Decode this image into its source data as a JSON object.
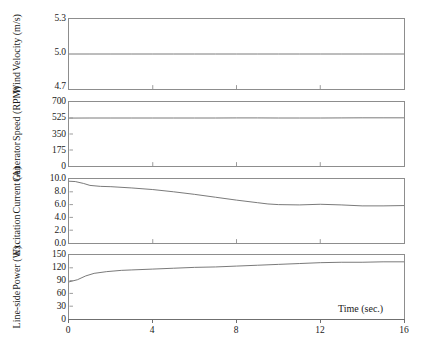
{
  "figure": {
    "xlabel": "Time (sec.)",
    "xticks": [
      "0",
      "4",
      "8",
      "12",
      "16"
    ],
    "xlim": [
      0,
      16
    ],
    "line_color": "#5f5f5f",
    "frame_color": "#8d8d8d"
  },
  "chart_data": [
    {
      "type": "line",
      "title": "",
      "panel_index": 0,
      "ylabel": "Wind Velocity (m/s)",
      "ylabel_lines": [
        "Wind",
        "Velocity (m/s)"
      ],
      "xlabel": "",
      "xlim": [
        0,
        16
      ],
      "ylim": [
        4.7,
        5.3
      ],
      "yticks": [
        "4.7",
        "5.0",
        "5.3"
      ],
      "ytick_values": [
        4.7,
        5.0,
        5.3
      ],
      "xticks": [
        "0",
        "4",
        "8",
        "12",
        "16"
      ],
      "grid": false,
      "legend": "none",
      "x": [
        0,
        1,
        2,
        3,
        4,
        5,
        6,
        7,
        8,
        9,
        10,
        11,
        12,
        13,
        14,
        15,
        16
      ],
      "values": [
        5.0,
        5.0,
        5.0,
        5.0,
        5.0,
        5.0,
        5.0,
        5.0,
        5.0,
        5.0,
        5.0,
        5.0,
        5.0,
        5.0,
        5.0,
        5.0,
        5.0
      ]
    },
    {
      "type": "line",
      "title": "",
      "panel_index": 1,
      "ylabel": "Generator Speed (RPM)",
      "ylabel_lines": [
        "Generator",
        "Speed (RPM)"
      ],
      "xlabel": "",
      "xlim": [
        0,
        16
      ],
      "ylim": [
        0,
        700
      ],
      "yticks": [
        "0",
        "175",
        "350",
        "525",
        "700"
      ],
      "ytick_values": [
        0,
        175,
        350,
        525,
        700
      ],
      "xticks": [
        "0",
        "4",
        "8",
        "12",
        "16"
      ],
      "grid": false,
      "legend": "none",
      "x": [
        0,
        1,
        2,
        3,
        4,
        5,
        6,
        7,
        8,
        9,
        10,
        11,
        12,
        13,
        14,
        15,
        16
      ],
      "values": [
        524,
        525,
        525,
        525,
        525,
        525,
        525,
        525,
        526,
        526,
        525,
        525,
        525,
        526,
        527,
        527,
        527
      ]
    },
    {
      "type": "line",
      "title": "",
      "panel_index": 2,
      "ylabel": "Excitation Current (A)",
      "ylabel_lines": [
        "Excitation",
        "Current (A)"
      ],
      "xlabel": "",
      "xlim": [
        0,
        16
      ],
      "ylim": [
        0.0,
        10.0
      ],
      "yticks": [
        "0.0",
        "2.0",
        "4.0",
        "6.0",
        "8.0",
        "10.0"
      ],
      "ytick_values": [
        0.0,
        2.0,
        4.0,
        6.0,
        8.0,
        10.0
      ],
      "xticks": [
        "0",
        "4",
        "8",
        "12",
        "16"
      ],
      "grid": false,
      "legend": "none",
      "x": [
        0,
        0.3,
        0.7,
        1.0,
        1.5,
        2.0,
        3.0,
        4.0,
        5.0,
        6.0,
        7.0,
        8.0,
        9.0,
        9.5,
        10.0,
        11.0,
        12.0,
        13.0,
        14.0,
        15.0,
        16.0
      ],
      "values": [
        9.65,
        9.6,
        9.3,
        9.0,
        8.85,
        8.8,
        8.6,
        8.35,
        8.0,
        7.6,
        7.15,
        6.7,
        6.3,
        6.1,
        6.0,
        5.95,
        6.05,
        5.95,
        5.8,
        5.8,
        5.85
      ]
    },
    {
      "type": "line",
      "title": "",
      "panel_index": 3,
      "ylabel": "Line-side Power (W)",
      "ylabel_lines": [
        "Line-side",
        "Power (W)"
      ],
      "xlabel": "Time (sec.)",
      "xlim": [
        0,
        16
      ],
      "ylim": [
        0,
        150
      ],
      "yticks": [
        "0",
        "30",
        "60",
        "90",
        "120",
        "150"
      ],
      "ytick_values": [
        0,
        30,
        60,
        90,
        120,
        150
      ],
      "xticks": [
        "0",
        "4",
        "8",
        "12",
        "16"
      ],
      "grid": false,
      "legend": "none",
      "x": [
        0,
        0.4,
        0.8,
        1.2,
        1.8,
        2.5,
        3.0,
        4.0,
        5.0,
        6.0,
        7.0,
        8.0,
        9.0,
        10.0,
        11.0,
        12.0,
        13.0,
        14.0,
        15.0,
        16.0
      ],
      "values": [
        87,
        92,
        101,
        107,
        111,
        114,
        115,
        117,
        119,
        121,
        122,
        124,
        126,
        128,
        130,
        132,
        133,
        133,
        134,
        134
      ]
    }
  ]
}
